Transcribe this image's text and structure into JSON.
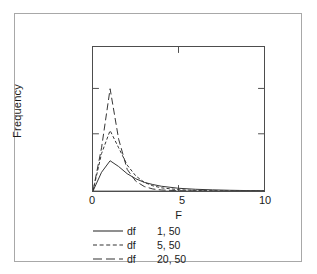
{
  "chart_data": {
    "type": "line",
    "title": "",
    "subtitle": "",
    "xlabel": "F",
    "ylabel": "Frequency",
    "xlim": [
      0,
      10
    ],
    "ylim": [
      0,
      1.0
    ],
    "xticks": [
      0,
      5,
      10
    ],
    "xticklabels": [
      "0",
      "5",
      "10"
    ],
    "yticks": [
      0.37,
      0.74
    ],
    "yticklabels": [
      "",
      ""
    ],
    "grid": false,
    "legend_position": "below-axes",
    "frame": "full-box",
    "x": [
      0,
      0.5,
      1,
      1.5,
      2,
      2.5,
      3,
      3.5,
      4,
      5,
      6,
      7,
      8,
      9,
      10
    ],
    "series": [
      {
        "name": "df  1, 50",
        "label_prefix": "df",
        "label_value": "1, 50",
        "style": "solid",
        "color": "#333333",
        "values": [
          0.0,
          0.13,
          0.21,
          0.17,
          0.12,
          0.085,
          0.06,
          0.045,
          0.033,
          0.019,
          0.012,
          0.008,
          0.005,
          0.003,
          0.002
        ]
      },
      {
        "name": "df  5, 50",
        "label_prefix": "df",
        "label_value": "5, 50",
        "style": "short-dashed",
        "color": "#333333",
        "values": [
          0.0,
          0.26,
          0.42,
          0.3,
          0.18,
          0.105,
          0.06,
          0.036,
          0.022,
          0.009,
          0.004,
          0.002,
          0.001,
          0.001,
          0.0
        ]
      },
      {
        "name": "df 20, 50",
        "label_prefix": "df",
        "label_value": "20, 50",
        "style": "long-dashed",
        "color": "#333333",
        "values": [
          0.0,
          0.3,
          0.71,
          0.36,
          0.15,
          0.068,
          0.031,
          0.014,
          0.007,
          0.002,
          0.001,
          0.0,
          0.0,
          0.0,
          0.0
        ]
      }
    ]
  },
  "axes": {
    "y_title": "Frequency",
    "x_title": "F",
    "x_tick_labels": [
      "0",
      "5",
      "10"
    ]
  },
  "legend": {
    "entries": [
      {
        "prefix": "df",
        "value": "1, 50",
        "style": "solid"
      },
      {
        "prefix": "df",
        "value": "5, 50",
        "style": "short-dashed"
      },
      {
        "prefix": "df",
        "value": "20, 50",
        "style": "long-dashed"
      }
    ]
  },
  "colors": {
    "line": "#333333",
    "axis": "#4d4d4d",
    "outer_frame": "#a8a8a8",
    "background": "#ffffff"
  }
}
